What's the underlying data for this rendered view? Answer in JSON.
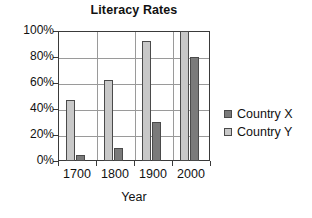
{
  "chart_data": {
    "type": "bar",
    "title": "Literacy Rates",
    "xlabel": "Year",
    "ylabel": "",
    "categories": [
      "1700",
      "1800",
      "1900",
      "2000"
    ],
    "series": [
      {
        "name": "Country X",
        "color": "#7a7a7a",
        "values": [
          5,
          10,
          30,
          80
        ]
      },
      {
        "name": "Country Y",
        "color": "#c8c8c8",
        "values": [
          47,
          62,
          92,
          100
        ]
      }
    ],
    "draw_order": [
      "Country Y",
      "Country X"
    ],
    "ylim": [
      0,
      100
    ],
    "ytick_labels": [
      "0%",
      "20%",
      "40%",
      "60%",
      "80%",
      "100%"
    ],
    "ytick_values": [
      0,
      20,
      40,
      60,
      80,
      100
    ],
    "grid": "horizontal-and-category-separators",
    "legend_position": "right"
  },
  "legend": {
    "entries": [
      {
        "label": "Country X"
      },
      {
        "label": "Country Y"
      }
    ]
  }
}
